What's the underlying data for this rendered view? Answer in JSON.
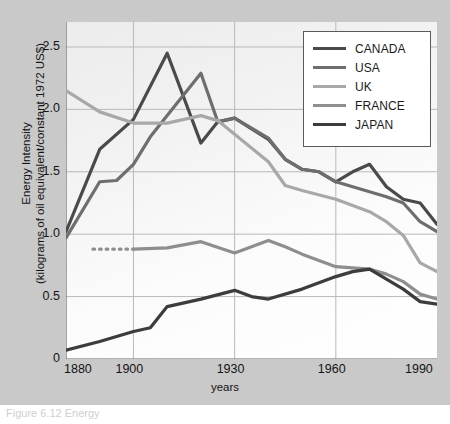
{
  "figure": {
    "background_color": "#c9c9c9",
    "plot_background": "#f5f5f5",
    "caption": "Figure 6.12  Energy"
  },
  "axes": {
    "y_title_line1": "Energy Intensity",
    "y_title_line2": "(kilograms of oil equivalent/constant 1972 US$)",
    "x_title": "years",
    "y_ticks": [
      "0",
      "0.5",
      "1.0",
      "1.5",
      "2.0",
      "2.5"
    ],
    "x_ticks": [
      "1880",
      "1900",
      "1930",
      "1960",
      "1990"
    ]
  },
  "legend": {
    "position": "top-right",
    "entries": [
      {
        "label": "CANADA",
        "color": "#4a4a4a"
      },
      {
        "label": "USA",
        "color": "#6e6e6e"
      },
      {
        "label": "UK",
        "color": "#a8a8a8"
      },
      {
        "label": "FRANCE",
        "color": "#8e8e8e"
      },
      {
        "label": "JAPAN",
        "color": "#3c3c3c"
      }
    ]
  },
  "chart_data": {
    "type": "line",
    "title": "",
    "xlabel": "years",
    "ylabel": "Energy Intensity (kilograms of oil equivalent/constant 1972 US$)",
    "xlim": [
      1880,
      1990
    ],
    "ylim": [
      0,
      2.7
    ],
    "grid": true,
    "gridlines_y": [
      0.5,
      1.0,
      1.5,
      2.0,
      2.5
    ],
    "gridlines_x": [
      1900,
      1930,
      1960
    ],
    "legend_position": "top-right",
    "annotations": [
      "FRANCE series begins with a dotted segment from 1888 to 1900 at about 0.88"
    ],
    "series": [
      {
        "name": "CANADA",
        "color": "#4a4a4a",
        "x": [
          1880,
          1890,
          1900,
          1910,
          1920,
          1925,
          1930,
          1940,
          1945,
          1950,
          1955,
          1960,
          1965,
          1970,
          1975,
          1980,
          1985,
          1990
        ],
        "values": [
          1.02,
          1.68,
          1.92,
          2.45,
          1.73,
          1.9,
          1.93,
          1.76,
          1.6,
          1.52,
          1.5,
          1.42,
          1.5,
          1.56,
          1.38,
          1.28,
          1.25,
          1.08
        ]
      },
      {
        "name": "USA",
        "color": "#6e6e6e",
        "x": [
          1880,
          1890,
          1895,
          1900,
          1905,
          1910,
          1920,
          1925,
          1930,
          1940,
          1945,
          1950,
          1955,
          1960,
          1965,
          1970,
          1975,
          1980,
          1985,
          1990
        ],
        "values": [
          0.97,
          1.42,
          1.43,
          1.56,
          1.78,
          1.95,
          2.29,
          1.9,
          1.93,
          1.77,
          1.6,
          1.52,
          1.5,
          1.42,
          1.38,
          1.34,
          1.3,
          1.25,
          1.1,
          1.02
        ]
      },
      {
        "name": "UK",
        "color": "#a8a8a8",
        "x": [
          1880,
          1890,
          1900,
          1910,
          1920,
          1925,
          1930,
          1940,
          1945,
          1950,
          1960,
          1970,
          1975,
          1980,
          1985,
          1990
        ],
        "values": [
          2.15,
          1.98,
          1.89,
          1.89,
          1.95,
          1.91,
          1.8,
          1.58,
          1.39,
          1.35,
          1.28,
          1.18,
          1.1,
          0.99,
          0.77,
          0.7
        ]
      },
      {
        "name": "FRANCE",
        "color": "#8e8e8e",
        "x": [
          1888,
          1900,
          1910,
          1920,
          1930,
          1940,
          1945,
          1950,
          1960,
          1965,
          1970,
          1975,
          1980,
          1985,
          1990
        ],
        "values": [
          0.88,
          0.88,
          0.89,
          0.94,
          0.85,
          0.95,
          0.9,
          0.84,
          0.74,
          0.73,
          0.72,
          0.68,
          0.62,
          0.52,
          0.48
        ]
      },
      {
        "name": "JAPAN",
        "color": "#3c3c3c",
        "x": [
          1880,
          1890,
          1900,
          1905,
          1910,
          1920,
          1930,
          1935,
          1940,
          1950,
          1960,
          1965,
          1970,
          1975,
          1980,
          1985,
          1990
        ],
        "values": [
          0.07,
          0.14,
          0.22,
          0.25,
          0.42,
          0.48,
          0.55,
          0.5,
          0.48,
          0.56,
          0.66,
          0.7,
          0.72,
          0.64,
          0.56,
          0.46,
          0.44
        ]
      }
    ]
  }
}
